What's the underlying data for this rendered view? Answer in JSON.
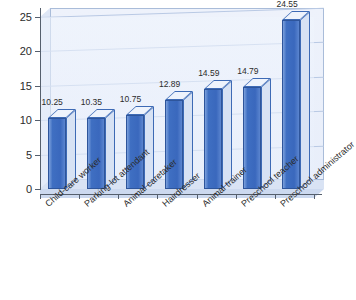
{
  "chart_data": {
    "type": "bar",
    "title": "",
    "xlabel": "",
    "ylabel": "",
    "ylim": [
      0,
      25
    ],
    "yticks": [
      0,
      5,
      10,
      15,
      20,
      25
    ],
    "grid": true,
    "legend": false,
    "legend_position": "none",
    "style": "3d-column",
    "categories": [
      "Child-care worker",
      "Parking lot attendant",
      "Animal caretaker",
      "Hairdresser",
      "Animal trainer",
      "Preschool teacher",
      "Preschool administrator"
    ],
    "values": [
      10.25,
      10.35,
      10.75,
      12.89,
      14.59,
      14.79,
      24.55
    ],
    "value_labels": [
      "10.25",
      "10.35",
      "10.75",
      "12.89",
      "14.59",
      "14.79",
      "24.55"
    ]
  },
  "colors": {
    "bar_front": "#3f6fc2",
    "bar_top": "#eef3fc",
    "bar_side": "#d7e2f4",
    "bar_outline": "#2e559b",
    "plot_background": "#eef2fb",
    "gridline": "#b9c9e4",
    "axis": "#555f6d",
    "floor": "#ccd9ef",
    "wall_border": "#a9bcd9",
    "text": "#2b2b2b",
    "page_background": "#ffffff"
  }
}
